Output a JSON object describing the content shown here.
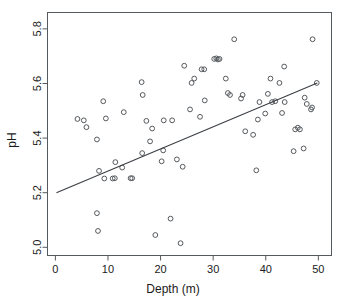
{
  "chart_data": {
    "type": "scatter",
    "title": "",
    "subtitle": "",
    "xlabel": "Depth (m)",
    "ylabel": "pH",
    "xlim": [
      -1.5,
      52.5
    ],
    "ylim": [
      4.97,
      5.86
    ],
    "grid": false,
    "legend": null,
    "x_ticks": [
      0,
      10,
      20,
      30,
      40,
      50
    ],
    "x_tick_labels": [
      "0",
      "10",
      "20",
      "30",
      "40",
      "50"
    ],
    "y_ticks": [
      5.0,
      5.2,
      5.4,
      5.6,
      5.8
    ],
    "y_tick_labels": [
      "5.0",
      "5.2",
      "5.4",
      "5.6",
      "5.8"
    ],
    "marker": "open-circle",
    "marker_color": "#55595d",
    "line_color": "#3b3f44",
    "frame_color": "#555a5e",
    "background": "#ffffff",
    "annotations": [],
    "series": [
      {
        "name": "pH vs Depth",
        "type": "scatter",
        "points": [
          [
            4.2,
            5.47
          ],
          [
            5.4,
            5.465
          ],
          [
            5.9,
            5.44
          ],
          [
            7.9,
            5.395
          ],
          [
            7.9,
            5.125
          ],
          [
            8.1,
            5.06
          ],
          [
            8.3,
            5.28
          ],
          [
            9.1,
            5.535
          ],
          [
            9.3,
            5.252
          ],
          [
            9.6,
            5.472
          ],
          [
            10.9,
            5.252
          ],
          [
            11.3,
            5.253
          ],
          [
            11.4,
            5.312
          ],
          [
            12.7,
            5.292
          ],
          [
            13.0,
            5.495
          ],
          [
            14.3,
            5.253
          ],
          [
            14.6,
            5.253
          ],
          [
            16.4,
            5.605
          ],
          [
            16.5,
            5.345
          ],
          [
            16.6,
            5.558
          ],
          [
            17.3,
            5.463
          ],
          [
            18.0,
            5.388
          ],
          [
            18.4,
            5.435
          ],
          [
            19.0,
            5.045
          ],
          [
            20.2,
            5.315
          ],
          [
            20.5,
            5.355
          ],
          [
            20.6,
            5.465
          ],
          [
            21.9,
            5.105
          ],
          [
            22.2,
            5.465
          ],
          [
            23.1,
            5.322
          ],
          [
            23.8,
            5.015
          ],
          [
            24.2,
            5.295
          ],
          [
            24.5,
            5.665
          ],
          [
            25.6,
            5.505
          ],
          [
            25.9,
            5.602
          ],
          [
            26.4,
            5.618
          ],
          [
            27.5,
            5.478
          ],
          [
            27.8,
            5.652
          ],
          [
            28.3,
            5.652
          ],
          [
            28.4,
            5.538
          ],
          [
            30.2,
            5.69
          ],
          [
            30.6,
            5.692
          ],
          [
            30.9,
            5.688
          ],
          [
            31.2,
            5.69
          ],
          [
            32.4,
            5.618
          ],
          [
            32.8,
            5.565
          ],
          [
            33.2,
            5.558
          ],
          [
            34.0,
            5.762
          ],
          [
            35.3,
            5.545
          ],
          [
            35.6,
            5.558
          ],
          [
            36.1,
            5.425
          ],
          [
            37.6,
            5.412
          ],
          [
            38.2,
            5.282
          ],
          [
            38.5,
            5.468
          ],
          [
            38.8,
            5.532
          ],
          [
            39.9,
            5.49
          ],
          [
            40.4,
            5.562
          ],
          [
            40.9,
            5.618
          ],
          [
            41.2,
            5.532
          ],
          [
            41.8,
            5.535
          ],
          [
            42.6,
            5.602
          ],
          [
            43.1,
            5.492
          ],
          [
            43.5,
            5.662
          ],
          [
            43.6,
            5.532
          ],
          [
            45.3,
            5.352
          ],
          [
            45.6,
            5.432
          ],
          [
            46.1,
            5.438
          ],
          [
            46.5,
            5.432
          ],
          [
            47.2,
            5.362
          ],
          [
            47.4,
            5.548
          ],
          [
            47.8,
            5.525
          ],
          [
            48.6,
            5.505
          ],
          [
            48.8,
            5.512
          ],
          [
            48.9,
            5.762
          ],
          [
            49.7,
            5.602
          ]
        ]
      }
    ],
    "fit_line": {
      "name": "linear-regression",
      "x_start": 0.2,
      "y_start": 5.2,
      "x_end": 49.8,
      "y_end": 5.602,
      "slope": 0.0081,
      "intercept": 5.198
    }
  }
}
